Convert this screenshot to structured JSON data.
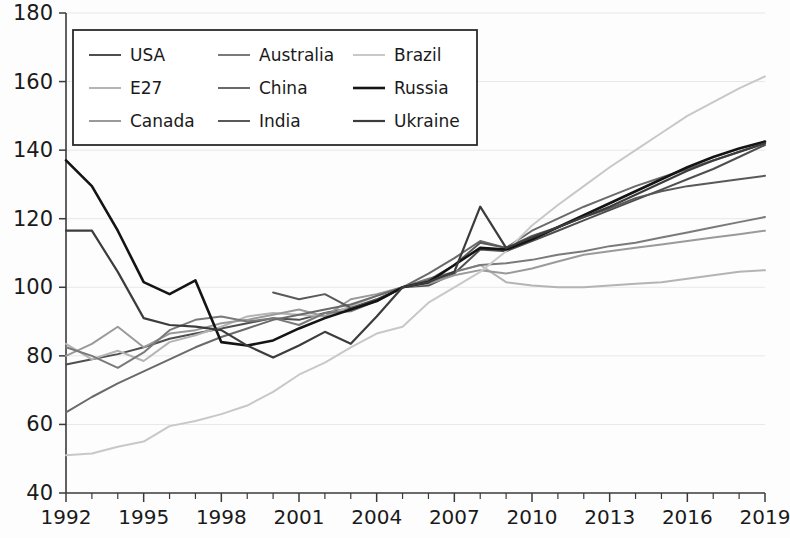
{
  "chart_data": {
    "type": "line",
    "title": "",
    "subtitle": "",
    "xlabel": "",
    "ylabel": "",
    "xlim": [
      1992,
      2019
    ],
    "ylim": [
      40,
      180
    ],
    "yticks": [
      40,
      60,
      80,
      100,
      120,
      140,
      160,
      180
    ],
    "xticks": [
      1992,
      1995,
      1998,
      2001,
      2004,
      2007,
      2010,
      2013,
      2016,
      2019
    ],
    "x_tick_step": 3,
    "x_minor_tick_step": 1,
    "grid": "horizontal",
    "legend_position": "top-left-inside",
    "legend_columns": 3,
    "legend_rows": 3,
    "x": [
      1992,
      1993,
      1994,
      1995,
      1996,
      1997,
      1998,
      1999,
      2000,
      2001,
      2002,
      2003,
      2004,
      2005,
      2006,
      2007,
      2008,
      2009,
      2010,
      2011,
      2012,
      2013,
      2014,
      2015,
      2016,
      2017,
      2018,
      2019
    ],
    "series": [
      {
        "name": "USA",
        "color": "#4f4f4f",
        "width": 2.0,
        "values": [
          77.5,
          79.0,
          80.5,
          82.5,
          85.0,
          86.5,
          88.0,
          89.5,
          91.0,
          90.5,
          92.5,
          94.0,
          96.5,
          100.0,
          100.5,
          104.0,
          111.0,
          110.5,
          113.5,
          116.5,
          119.5,
          122.5,
          125.5,
          128.5,
          131.5,
          134.5,
          138.0,
          141.5
        ]
      },
      {
        "name": "E27",
        "color": "#b4b4b4",
        "width": 2.0,
        "values": [
          83.5,
          79.0,
          81.5,
          78.5,
          84.0,
          86.0,
          88.5,
          91.5,
          92.5,
          92.0,
          91.5,
          94.5,
          97.5,
          100.0,
          101.5,
          104.5,
          106.5,
          101.5,
          100.5,
          100.0,
          100.0,
          100.5,
          101.0,
          101.5,
          102.5,
          103.5,
          104.5,
          105.0
        ]
      },
      {
        "name": "Canada",
        "color": "#9a9a9a",
        "width": 2.0,
        "values": [
          80.0,
          83.5,
          88.5,
          82.5,
          86.5,
          87.5,
          89.5,
          90.5,
          92.0,
          93.5,
          91.5,
          96.5,
          98.0,
          100.0,
          101.0,
          103.5,
          105.0,
          104.0,
          105.5,
          107.5,
          109.5,
          110.5,
          111.5,
          112.5,
          113.5,
          114.5,
          115.5,
          116.5
        ]
      },
      {
        "name": "Australia",
        "color": "#7a7a7a",
        "width": 2.0,
        "values": [
          82.5,
          80.0,
          76.5,
          81.0,
          87.5,
          90.5,
          91.5,
          90.0,
          91.0,
          89.0,
          92.5,
          93.0,
          96.0,
          100.0,
          102.5,
          104.5,
          106.5,
          107.0,
          108.0,
          109.5,
          110.5,
          112.0,
          113.0,
          114.5,
          116.0,
          117.5,
          119.0,
          120.5
        ]
      },
      {
        "name": "China",
        "color": "#6a6a6a",
        "width": 2.0,
        "values": [
          63.5,
          68.0,
          72.0,
          75.5,
          79.0,
          82.5,
          85.5,
          88.0,
          90.5,
          92.0,
          93.5,
          95.0,
          97.5,
          100.0,
          104.0,
          108.5,
          113.5,
          111.5,
          116.5,
          120.0,
          123.5,
          126.5,
          129.5,
          132.0,
          134.5,
          137.0,
          139.5,
          142.0
        ]
      },
      {
        "name": "India",
        "color": "#595959",
        "width": 2.0,
        "values": [
          null,
          null,
          null,
          null,
          null,
          null,
          null,
          null,
          98.5,
          96.5,
          98.0,
          94.0,
          96.0,
          100.0,
          102.0,
          106.5,
          113.0,
          111.5,
          115.0,
          117.5,
          120.5,
          123.0,
          126.0,
          128.0,
          129.5,
          130.5,
          131.5,
          132.5
        ]
      },
      {
        "name": "Brazil",
        "color": "#c8c8c8",
        "width": 2.0,
        "values": [
          51.0,
          51.5,
          53.5,
          55.0,
          59.5,
          61.0,
          63.0,
          65.5,
          69.5,
          74.5,
          78.0,
          82.5,
          86.5,
          88.5,
          95.5,
          100.0,
          104.5,
          110.5,
          118.0,
          124.0,
          129.5,
          135.0,
          140.0,
          145.0,
          150.0,
          154.0,
          158.0,
          161.5
        ]
      },
      {
        "name": "Russia",
        "color": "#141414",
        "width": 2.6,
        "values": [
          137.0,
          129.5,
          116.5,
          101.5,
          98.0,
          102.0,
          84.0,
          83.0,
          84.5,
          88.0,
          91.0,
          93.5,
          96.0,
          100.0,
          101.5,
          106.5,
          111.5,
          111.0,
          114.0,
          117.5,
          121.0,
          124.5,
          128.0,
          131.5,
          135.0,
          138.0,
          140.5,
          142.5
        ]
      },
      {
        "name": "Ukraine",
        "color": "#3c3c3c",
        "width": 2.2,
        "values": [
          116.5,
          116.5,
          104.5,
          91.0,
          89.0,
          88.5,
          87.5,
          83.0,
          79.5,
          83.0,
          87.0,
          83.5,
          91.5,
          100.0,
          101.5,
          104.5,
          123.5,
          111.5,
          114.5,
          117.5,
          120.5,
          123.5,
          127.0,
          130.5,
          134.0,
          137.0,
          139.5,
          142.0
        ]
      }
    ]
  },
  "legend": {
    "entries": [
      {
        "label": "USA",
        "color": "#4f4f4f",
        "width": 2.0
      },
      {
        "label": "Australia",
        "color": "#7a7a7a",
        "width": 2.0
      },
      {
        "label": "Brazil",
        "color": "#c8c8c8",
        "width": 2.0
      },
      {
        "label": "E27",
        "color": "#b4b4b4",
        "width": 2.0
      },
      {
        "label": "China",
        "color": "#6a6a6a",
        "width": 2.0
      },
      {
        "label": "Russia",
        "color": "#141414",
        "width": 2.6
      },
      {
        "label": "Canada",
        "color": "#9a9a9a",
        "width": 2.0
      },
      {
        "label": "India",
        "color": "#595959",
        "width": 2.0
      },
      {
        "label": "Ukraine",
        "color": "#3c3c3c",
        "width": 2.2
      }
    ]
  },
  "axes": {
    "y_tick_labels": [
      "180",
      "160",
      "140",
      "120",
      "100",
      "80",
      "60",
      "40"
    ],
    "x_tick_labels": [
      "1992",
      "1995",
      "1998",
      "2001",
      "2004",
      "2007",
      "2010",
      "2013",
      "2016",
      "2019"
    ]
  },
  "colors": {
    "background": "#fdfdfd",
    "axis": "#3a3a3a",
    "grid": "#e8e8e8",
    "text": "#1a1a1a",
    "legend_border": "#2b2b2b"
  }
}
